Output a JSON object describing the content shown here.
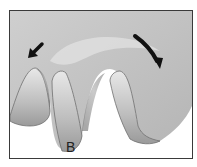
{
  "figure": {
    "type": "illustration",
    "labels": [
      {
        "id": "B",
        "text": "B"
      }
    ],
    "arrows": [
      {
        "name": "left-arrow",
        "direction": "down-left"
      },
      {
        "name": "right-arrow",
        "direction": "curved-down-right"
      }
    ],
    "colors": {
      "background": "#ffffff",
      "frame": "#3a3a3a",
      "tooth_light": "#d9d9d9",
      "tooth_shadow": "#8c8c8c",
      "arrow": "#111111"
    }
  }
}
